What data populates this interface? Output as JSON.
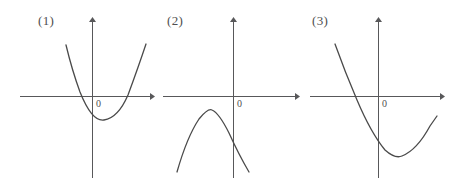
{
  "figure": {
    "title": "",
    "background_color": "#ffffff",
    "stroke_color": "#4a4a4a",
    "axis_color": "#58585a",
    "panels": [
      {
        "id": "panel-1",
        "label": "(1)",
        "origin_label": "0",
        "curve_type": "parabola",
        "opening": "up",
        "vertex_below_x_axis": true,
        "x_intercepts": 2,
        "description": "upward parabola, vertex slightly right of and below the origin, crossing the x-axis twice"
      },
      {
        "id": "panel-2",
        "label": "(2)",
        "origin_label": "0",
        "curve_type": "parabola",
        "opening": "down",
        "vertex_below_x_axis": true,
        "x_intercepts": 0,
        "description": "downward parabola entirely below the x-axis, vertex left of the origin"
      },
      {
        "id": "panel-3",
        "label": "(3)",
        "origin_label": "0",
        "curve_type": "parabola",
        "opening": "up",
        "vertex_below_x_axis": true,
        "x_intercepts": 1,
        "description": "upward parabola shifted right and far below, crossing the x-axis on the left of the origin"
      }
    ],
    "axis_icons": {
      "x_axis": "arrow-right-icon",
      "y_axis": "arrow-up-icon"
    }
  }
}
